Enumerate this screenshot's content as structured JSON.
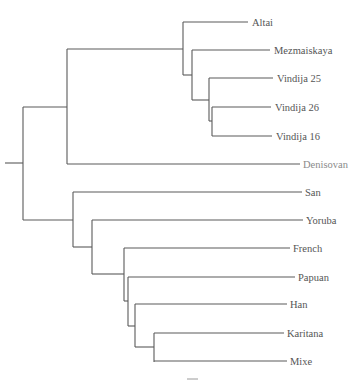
{
  "diagram": {
    "type": "phylogenetic-tree",
    "colors": {
      "branch": "#5a5a5a",
      "label": "#555555",
      "outgroup_label": "#8a8a8a"
    },
    "tips": [
      {
        "id": "altai",
        "label": "Altai",
        "y": 22,
        "x_end": 248
      },
      {
        "id": "mezmaiskaya",
        "label": "Mezmaiskaya",
        "y": 50,
        "x_end": 270
      },
      {
        "id": "vindija25",
        "label": "Vindija 25",
        "y": 78,
        "x_end": 273
      },
      {
        "id": "vindija26",
        "label": "Vindija 26",
        "y": 107,
        "x_end": 271
      },
      {
        "id": "vindija16",
        "label": "Vindija 16",
        "y": 136,
        "x_end": 272
      },
      {
        "id": "denisovan",
        "label": "Denisovan",
        "y": 164,
        "x_end": 300,
        "outgroup": true
      },
      {
        "id": "san",
        "label": "San",
        "y": 192,
        "x_end": 302
      },
      {
        "id": "yoruba",
        "label": "Yoruba",
        "y": 220,
        "x_end": 303
      },
      {
        "id": "french",
        "label": "French",
        "y": 248,
        "x_end": 290
      },
      {
        "id": "papuan",
        "label": "Papuan",
        "y": 277,
        "x_end": 295
      },
      {
        "id": "han",
        "label": "Han",
        "y": 304,
        "x_end": 287
      },
      {
        "id": "karitana",
        "label": "Karitana",
        "y": 333,
        "x_end": 284
      },
      {
        "id": "mixe",
        "label": "Mixe",
        "y": 361,
        "x_end": 287
      }
    ],
    "clades": {
      "archaic": "Altai, Mezmaiskaya, Vindija 25, Vindija 26, Vindija 16, Denisovan",
      "modern": "San, Yoruba, French, Papuan, Han, Karitana, Mixe"
    },
    "scale_bar": {
      "x1": 187,
      "x2": 198,
      "y": 379
    }
  }
}
